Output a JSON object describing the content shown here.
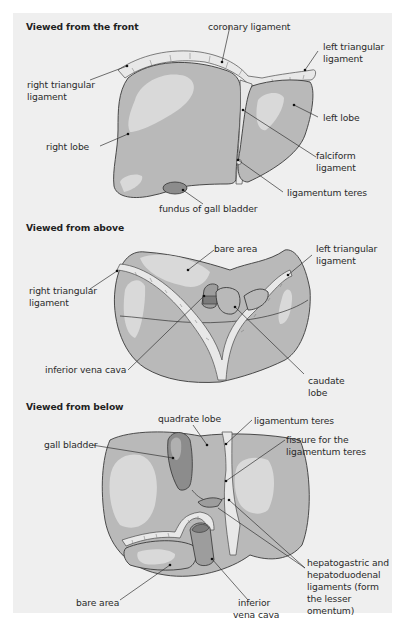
{
  "figure": {
    "panels": [
      {
        "id": "front",
        "heading": "Viewed from the front",
        "labels": {
          "coronary_ligament": "coronary ligament",
          "left_triangular_ligament_1": "left triangular",
          "left_triangular_ligament_2": "ligament",
          "right_triangular_ligament_1": "right triangular",
          "right_triangular_ligament_2": "ligament",
          "left_lobe": "left lobe",
          "right_lobe": "right lobe",
          "falciform_ligament_1": "falciform",
          "falciform_ligament_2": "ligament",
          "ligamentum_teres": "ligamentum teres",
          "fundus_gall_bladder": "fundus of gall bladder"
        }
      },
      {
        "id": "above",
        "heading": "Viewed from above",
        "labels": {
          "bare_area": "bare area",
          "left_triangular_ligament_1": "left triangular",
          "left_triangular_ligament_2": "ligament",
          "right_triangular_ligament_1": "right triangular",
          "right_triangular_ligament_2": "ligament",
          "inferior_vena_cava": "inferior vena cava",
          "caudate_lobe_1": "caudate",
          "caudate_lobe_2": "lobe"
        }
      },
      {
        "id": "below",
        "heading": "Viewed from below",
        "labels": {
          "quadrate_lobe": "quadrate lobe",
          "ligamentum_teres": "ligamentum teres",
          "gall_bladder": "gall bladder",
          "fissure_1": "fissure for the",
          "fissure_2": "ligamentum teres",
          "hepato_1": "hepatogastric and",
          "hepato_2": "hepatoduodenal",
          "hepato_3": "ligaments (form",
          "hepato_4": "the lesser",
          "hepato_5": "omentum)",
          "bare_area": "bare area",
          "ivc_1": "inferior",
          "ivc_2": "vena cava"
        }
      }
    ]
  },
  "colors": {
    "panel_bg": "#efefef",
    "liver": "#b9b9b9",
    "highlight": "#d9d9d9",
    "gall_bladder": "#8c8c8c"
  }
}
